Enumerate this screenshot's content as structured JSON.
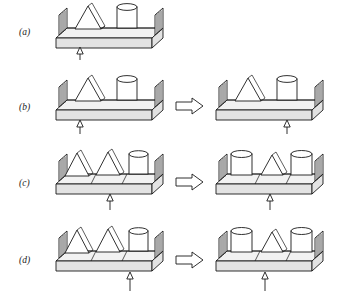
{
  "figure": {
    "background_color": "#ffffff",
    "line_color": "#1a1a1a",
    "width": 344,
    "height": 295
  },
  "transform_arrow": {
    "name": "rightwards-block-arrow",
    "glyph": "⇒",
    "count": 3
  },
  "fulcrum": {
    "name": "fulcrum-pointer",
    "description": "thin vertical line with small hollow upward arrowhead"
  },
  "rows": [
    {
      "id": "a",
      "label": "(a)",
      "has_transform_arrow": false,
      "panels": [
        {
          "side": "left",
          "objects": [
            {
              "type": "triangle",
              "slot": 1
            },
            {
              "type": "cylinder",
              "slot": 3
            }
          ],
          "dividers": [],
          "fulcrum_position_pct": 26
        }
      ]
    },
    {
      "id": "b",
      "label": "(b)",
      "has_transform_arrow": true,
      "panels": [
        {
          "side": "left",
          "objects": [
            {
              "type": "triangle",
              "slot": 1
            },
            {
              "type": "cylinder",
              "slot": 3
            }
          ],
          "dividers": [],
          "fulcrum_position_pct": 26
        },
        {
          "side": "right",
          "objects": [
            {
              "type": "triangle",
              "slot": 1
            },
            {
              "type": "cylinder",
              "slot": 3
            }
          ],
          "dividers": [],
          "fulcrum_position_pct": 74
        }
      ]
    },
    {
      "id": "c",
      "label": "(c)",
      "has_transform_arrow": true,
      "panels": [
        {
          "side": "left",
          "objects": [
            {
              "type": "triangle",
              "slot": 0
            },
            {
              "type": "triangle",
              "slot": 1
            },
            {
              "type": "cylinder",
              "slot": 2
            }
          ],
          "dividers": [
            1,
            2
          ],
          "fulcrum_position_pct": 50
        },
        {
          "side": "right",
          "objects": [
            {
              "type": "cylinder",
              "slot": 0
            },
            {
              "type": "triangle",
              "slot": 1
            },
            {
              "type": "cylinder",
              "slot": 2
            }
          ],
          "dividers": [
            1,
            2
          ],
          "fulcrum_position_pct": 50
        }
      ]
    },
    {
      "id": "d",
      "label": "(d)",
      "has_transform_arrow": true,
      "panels": [
        {
          "side": "left",
          "objects": [
            {
              "type": "triangle",
              "slot": 0
            },
            {
              "type": "triangle",
              "slot": 1
            },
            {
              "type": "cylinder",
              "slot": 2
            }
          ],
          "dividers": [
            1,
            2
          ],
          "fulcrum_position_pct": 68
        },
        {
          "side": "right",
          "objects": [
            {
              "type": "cylinder",
              "slot": 0
            },
            {
              "type": "triangle",
              "slot": 1
            },
            {
              "type": "cylinder",
              "slot": 2
            }
          ],
          "dividers": [
            1,
            2
          ],
          "fulcrum_position_pct": 45
        }
      ]
    }
  ]
}
